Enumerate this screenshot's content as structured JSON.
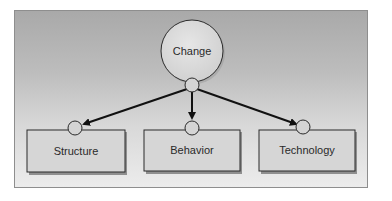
{
  "diagram": {
    "root": {
      "label": "Change"
    },
    "children": [
      {
        "label": "Structure"
      },
      {
        "label": "Behavior"
      },
      {
        "label": "Technology"
      }
    ],
    "colors": {
      "node_fill": "#d9d9d9",
      "node_stroke": "#2b2b2b",
      "arrow": "#111111",
      "frame_border": "#8e8e8e"
    }
  }
}
